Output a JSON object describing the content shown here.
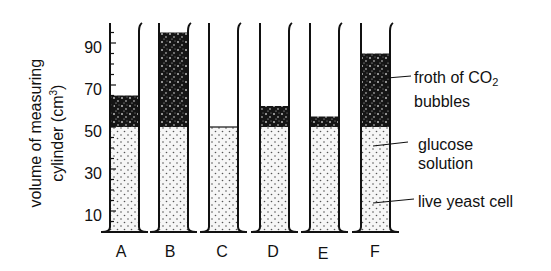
{
  "y_axis": {
    "label_line1": "volume of measuring",
    "label_line2": "cylinder (cm",
    "label_sup": "3",
    "label_close": ")",
    "ticks": [
      "90",
      "70",
      "50",
      "30",
      "10"
    ]
  },
  "cylinders": [
    {
      "id": "A",
      "label": "A",
      "liquid_level": 50,
      "froth_top": 65
    },
    {
      "id": "B",
      "label": "B",
      "liquid_level": 50,
      "froth_top": 95
    },
    {
      "id": "C",
      "label": "C",
      "liquid_level": 50,
      "froth_top": 50
    },
    {
      "id": "D",
      "label": "D",
      "liquid_level": 50,
      "froth_top": 60
    },
    {
      "id": "E",
      "label": "E",
      "liquid_level": 50,
      "froth_top": 55
    },
    {
      "id": "F",
      "label": "F",
      "liquid_level": 50,
      "froth_top": 85
    }
  ],
  "annotations": {
    "froth_line1": "froth of CO",
    "froth_sub": "2",
    "froth_line2": "bubbles",
    "glucose_line1": "glucose",
    "glucose_line2": "solution",
    "yeast": "live yeast cell"
  },
  "colors": {
    "ink": "#111111",
    "froth": "#1a1a1a",
    "liquid": "#f4f4f4",
    "background": "#ffffff"
  }
}
